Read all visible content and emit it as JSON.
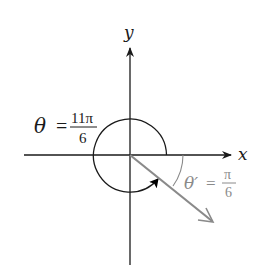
{
  "diagram": {
    "type": "angle-in-standard-position",
    "axes": {
      "x_label": "x",
      "y_label": "y"
    },
    "angle": {
      "symbol": "θ",
      "equals": "=",
      "numerator": "11π",
      "denominator": "6",
      "value_text": "θ = 11π/6"
    },
    "reference_angle": {
      "symbol": "θ′",
      "equals": "=",
      "numerator": "π",
      "denominator": "6",
      "value_text": "θ′ = π/6"
    },
    "colors": {
      "axes": "#1a1a1a",
      "angle_arc": "#1a1a1a",
      "terminal_ray": "#8a8a8a",
      "reference_label": "#8a8a8a",
      "background": "#ffffff"
    }
  }
}
